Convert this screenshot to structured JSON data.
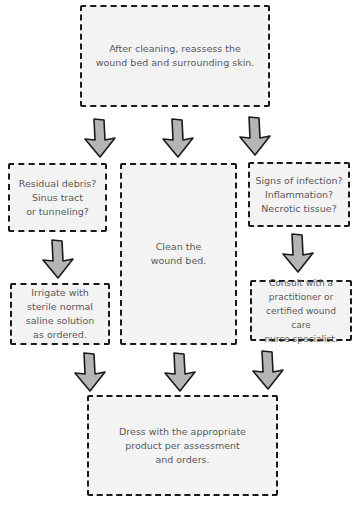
{
  "diagram": {
    "type": "flowchart",
    "colors": {
      "box_fill": "#f3f3f3",
      "border": "#1a1a1a",
      "text": "#5a5a5a",
      "arrow_fill": "#b5b5b5"
    },
    "nodes": {
      "reassess": "After cleaning, reassess the\nwound bed and surrounding skin.",
      "debris_question": "Residual debris?\nSinus tract\nor tunneling?",
      "clean": "Clean the\nwound bed.",
      "infection_question": "Signs of infection?\nInflammation?\nNecrotic tissue?",
      "irrigate": "Irrigate with\nsterile normal\nsaline solution\nas ordered.",
      "consult": "Consult with a\npractitioner or\ncertified wound care\nnurse specialist.",
      "dress": "Dress with the appropriate\nproduct per assessment\nand orders."
    },
    "edges": [
      [
        "reassess",
        "debris_question"
      ],
      [
        "reassess",
        "clean"
      ],
      [
        "reassess",
        "infection_question"
      ],
      [
        "debris_question",
        "irrigate"
      ],
      [
        "infection_question",
        "consult"
      ],
      [
        "irrigate",
        "dress"
      ],
      [
        "clean",
        "dress"
      ],
      [
        "consult",
        "dress"
      ]
    ],
    "arrow_icon": "block-down-arrow-icon"
  }
}
